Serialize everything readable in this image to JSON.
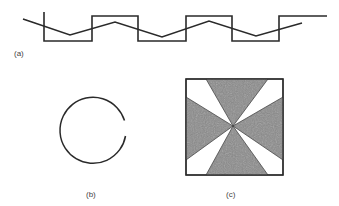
{
  "panels": {
    "a": {
      "label": "(a)",
      "description": "square wave with superimposed triangle wave"
    },
    "b": {
      "label": "(b)",
      "description": "open circle with small gap on the right"
    },
    "c": {
      "label": "(c)",
      "description": "square with shaded hourglass sectors meeting at center"
    }
  },
  "colors": {
    "stroke": "#2a2a2a",
    "fill_shaded": "#8a8a8a",
    "background": "#ffffff",
    "label": "#444444"
  }
}
